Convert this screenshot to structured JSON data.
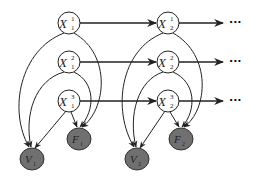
{
  "diagram": {
    "type": "dynamic bayesian network",
    "colors": {
      "hidden_node_fill": "#ffffff",
      "observed_node_fill": "#707070",
      "stroke": "#222222"
    },
    "slices": [
      {
        "index": 1,
        "hidden_nodes": [
          {
            "id": "X1_1",
            "label": "X",
            "sup": "1",
            "sub": "1"
          },
          {
            "id": "X1_2",
            "label": "X",
            "sup": "2",
            "sub": "1"
          },
          {
            "id": "X1_3",
            "label": "X",
            "sup": "3",
            "sub": "1"
          }
        ],
        "observed_nodes": [
          {
            "id": "V1",
            "label": "V",
            "sub": "1"
          },
          {
            "id": "F1",
            "label": "F",
            "sub": "1"
          }
        ]
      },
      {
        "index": 2,
        "hidden_nodes": [
          {
            "id": "X2_1",
            "label": "X",
            "sup": "1",
            "sub": "2"
          },
          {
            "id": "X2_2",
            "label": "X",
            "sup": "2",
            "sub": "2"
          },
          {
            "id": "X2_3",
            "label": "X",
            "sup": "3",
            "sub": "2"
          }
        ],
        "observed_nodes": [
          {
            "id": "V2",
            "label": "V",
            "sub": "2"
          },
          {
            "id": "F2",
            "label": "F",
            "sub": "2"
          }
        ]
      }
    ],
    "continuation": [
      "···",
      "···",
      "···"
    ],
    "edges": [
      "X1_1->X2_1",
      "X1_2->X2_2",
      "X1_3->X2_3",
      "X2_1->...",
      "X2_2->...",
      "X2_3->...",
      "X1_1->V1",
      "X1_1->F1",
      "X1_2->V1",
      "X1_2->F1",
      "X1_3->V1",
      "X1_3->F1",
      "X2_1->V2",
      "X2_1->F2",
      "X2_2->V2",
      "X2_2->F2",
      "X2_3->V2",
      "X2_3->F2"
    ]
  }
}
